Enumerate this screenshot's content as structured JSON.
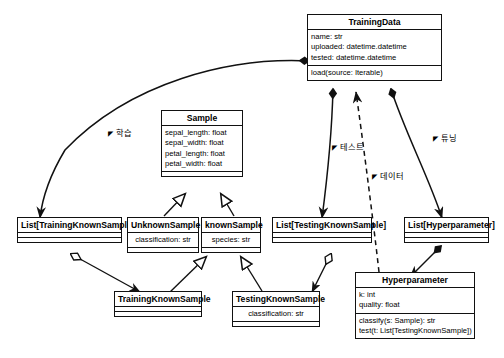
{
  "diagram": {
    "kind": "uml-class-diagram",
    "background_color": "#ffffff",
    "line_color": "#111111",
    "classes": [
      {
        "id": "training-data",
        "name": "TrainingData",
        "attributes": [
          "name: str",
          "uploaded: datetime.datetime",
          "tested: datetime.datetime"
        ],
        "methods": [
          "load(source: Iterable)"
        ]
      },
      {
        "id": "sample",
        "name": "Sample",
        "attributes": [
          "sepal_length: float",
          "sepal_width: float",
          "petal_length: float",
          "petal_width: float"
        ],
        "methods": []
      },
      {
        "id": "list-training-known-sample",
        "name": "List[TrainingKnownSample]",
        "attributes": [],
        "methods": []
      },
      {
        "id": "unknown-sample",
        "name": "UnknownSample",
        "attributes": [
          "classification: str"
        ],
        "methods": []
      },
      {
        "id": "known-sample",
        "name": "knownSample",
        "attributes": [
          "species: str"
        ],
        "methods": []
      },
      {
        "id": "list-testing-known-sample",
        "name": "List[TestingKnownSample]",
        "attributes": [],
        "methods": []
      },
      {
        "id": "list-hyperparameter",
        "name": "List[Hyperparameter]",
        "attributes": [],
        "methods": []
      },
      {
        "id": "training-known-sample",
        "name": "TrainingKnownSample",
        "attributes": [],
        "methods": []
      },
      {
        "id": "testing-known-sample",
        "name": "TestingKnownSample",
        "attributes": [
          "classification: str"
        ],
        "methods": []
      },
      {
        "id": "hyperparameter",
        "name": "Hyperparameter",
        "attributes": [
          "k: int",
          "quality: float"
        ],
        "methods": [
          "classify(s: Sample): str",
          "test(t: List[TestingKnownSample])"
        ]
      }
    ],
    "edge_labels": [
      {
        "id": "label-training",
        "text": "학습"
      },
      {
        "id": "label-test",
        "text": "테스트"
      },
      {
        "id": "label-data",
        "text": "데이터"
      },
      {
        "id": "label-tuning",
        "text": "튜닝"
      }
    ]
  }
}
